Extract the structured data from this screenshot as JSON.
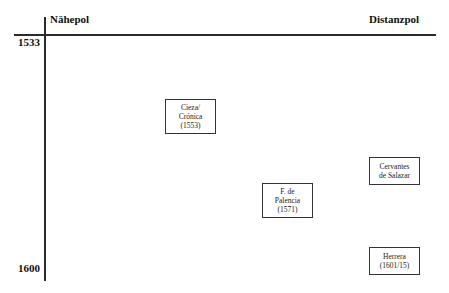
{
  "axes": {
    "left_pole": "Nähepol",
    "right_pole": "Distanzpol",
    "year_start": "1533",
    "year_end": "1600"
  },
  "boxes": [
    {
      "lines": [
        "Cieza/",
        "Crónica",
        "(1553)"
      ]
    },
    {
      "lines": [
        "F. de",
        "Palencia",
        "(1571)"
      ]
    },
    {
      "lines": [
        "Cervantes",
        "de Salazar"
      ]
    },
    {
      "lines": [
        "Herrera",
        "(1601/15)"
      ]
    }
  ]
}
